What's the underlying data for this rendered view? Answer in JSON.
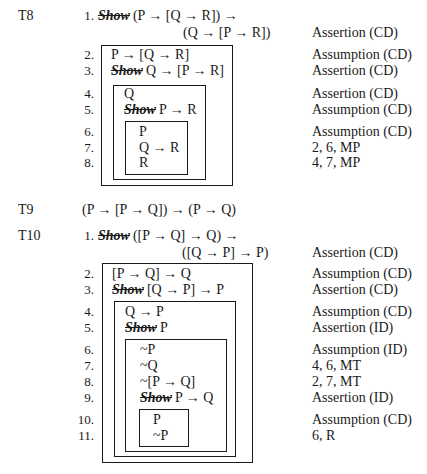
{
  "theorems": [
    {
      "label": "T8",
      "lines": [
        {
          "num": "1.",
          "show": "Show",
          "text": "(P → [Q → R]) →",
          "cont": "(Q → [P → R])",
          "just": "Assertion (CD)"
        },
        {
          "num": "2.",
          "show": "",
          "text": "P → [Q → R]",
          "just": "Assumption (CD)"
        },
        {
          "num": "3.",
          "show": "Show",
          "text": "Q → [P → R]",
          "just": "Assertion (CD)"
        },
        {
          "num": "4.",
          "show": "",
          "text": "Q",
          "just": "Assertion (CD)"
        },
        {
          "num": "5.",
          "show": "Show",
          "text": "P → R",
          "just": "Assumption (CD)"
        },
        {
          "num": "6.",
          "show": "",
          "text": "P",
          "just": "Assumption (CD)"
        },
        {
          "num": "7.",
          "show": "",
          "text": "Q → R",
          "just": "2, 6, MP"
        },
        {
          "num": "8.",
          "show": "",
          "text": "R",
          "just": "4, 7, MP"
        }
      ]
    },
    {
      "label": "T9",
      "formula": "(P → [P → Q]) → (P → Q)"
    },
    {
      "label": "T10",
      "lines": [
        {
          "num": "1.",
          "show": "Show",
          "text": "([P → Q] → Q) →",
          "cont": "([Q → P] → P)",
          "just": "Assertion (CD)"
        },
        {
          "num": "2.",
          "show": "",
          "text": "[P → Q] → Q",
          "just": "Assumption (CD)"
        },
        {
          "num": "3.",
          "show": "Show",
          "text": "[Q → P] → P",
          "just": "Assertion (CD)"
        },
        {
          "num": "4.",
          "show": "",
          "text": "Q → P",
          "just": "Assumption (CD)"
        },
        {
          "num": "5.",
          "show": "Show",
          "text": "P",
          "just": "Assertion (ID)"
        },
        {
          "num": "6.",
          "show": "",
          "text": "~P",
          "just": "Assumption (ID)"
        },
        {
          "num": "7.",
          "show": "",
          "text": "~Q",
          "just": "4, 6, MT"
        },
        {
          "num": "8.",
          "show": "",
          "text": "~[P → Q]",
          "just": "2, 7, MT"
        },
        {
          "num": "9.",
          "show": "Show",
          "text": "P → Q",
          "just": "Assertion (ID)"
        },
        {
          "num": "10.",
          "show": "",
          "text": "P",
          "just": "Assumption (CD)"
        },
        {
          "num": "11.",
          "show": "",
          "text": "~P",
          "just": "6, R"
        }
      ]
    }
  ]
}
